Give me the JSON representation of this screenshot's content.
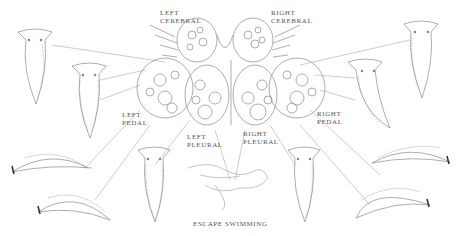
{
  "figure": {
    "labels": {
      "left_cerebral": [
        "LEFT",
        "CEREBRAL"
      ],
      "right_cerebral": [
        "RIGHT",
        "CEREBRAL"
      ],
      "left_pedal": [
        "LEFT",
        "PEDAL"
      ],
      "right_pedal": [
        "RIGHT",
        "PEDAL"
      ],
      "left_pleural": [
        "LEFT",
        "PLEURAL"
      ],
      "right_pleural": [
        "RIGHT",
        "PLEURAL"
      ],
      "escape_swimming": "ESCAPE SWIMMING"
    },
    "colors": {
      "ink": "#8a8a8a",
      "dark_ink": "#444444",
      "background": "#ffffff"
    }
  }
}
